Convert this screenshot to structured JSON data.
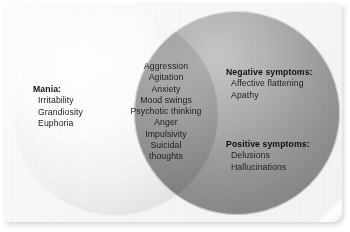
{
  "figure": {
    "type": "venn-diagram",
    "title": "",
    "set_count": 2
  },
  "left_set": {
    "name": "mania-circle",
    "heading": "Mania:",
    "items": [
      "Irritability",
      "Grandiosity",
      "Euphoria"
    ]
  },
  "overlap_set": {
    "name": "shared-symptoms",
    "heading": "",
    "items": [
      "Aggression",
      "Agitation",
      "Anxiety",
      "Mood swings",
      "Psychotic thinking",
      "Anger",
      "Impulsivity",
      "Suicidal",
      "thoughts"
    ]
  },
  "right_set": {
    "name": "schizophrenia-circle",
    "groups": [
      {
        "heading": "Negative symptoms:",
        "items": [
          "Affective flattening",
          "Apathy"
        ]
      },
      {
        "heading": "Positive symptoms:",
        "items": [
          "Delusions",
          "Hallucinations"
        ]
      }
    ]
  },
  "colors": {
    "page_background": "#ffffff",
    "card_background": "#f7f7f7",
    "left_circle": "#f0f0f0",
    "right_circle": "#9a9a9a",
    "overlap": "#8c8c8c",
    "text": "#1a1a1a"
  }
}
